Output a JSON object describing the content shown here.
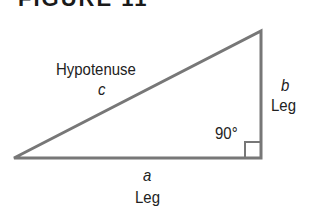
{
  "figure": {
    "title": "FIGURE 11",
    "hypotenuse_label": "Hypotenuse",
    "hypotenuse_var": "c",
    "vertical_leg_var": "b",
    "vertical_leg_label": "Leg",
    "horizontal_leg_var": "a",
    "horizontal_leg_label": "Leg",
    "angle_label": "90°",
    "line_color": "#777777"
  }
}
